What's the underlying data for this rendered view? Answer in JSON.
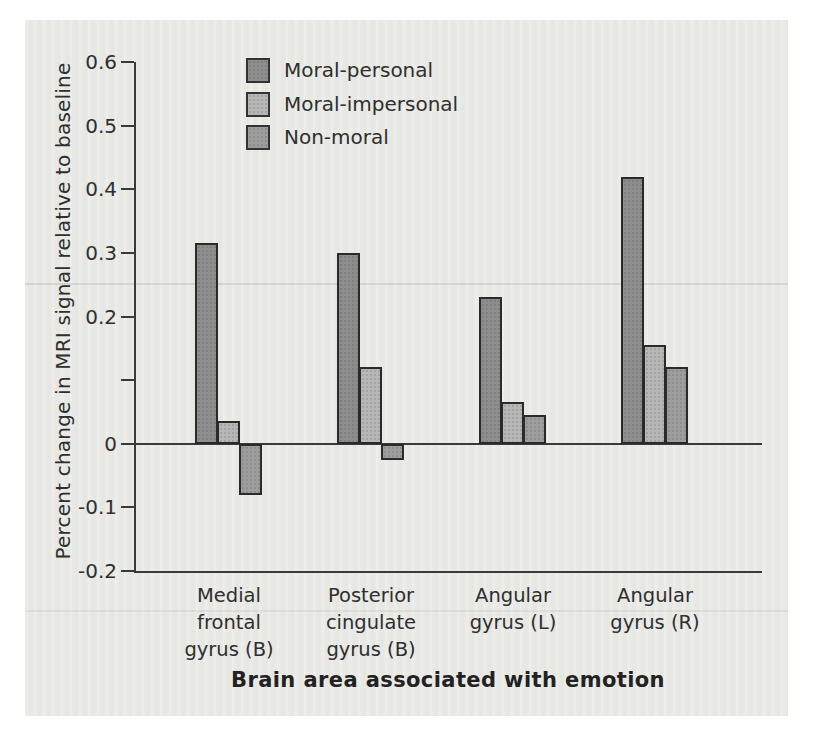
{
  "chart_data": {
    "type": "bar",
    "title": "",
    "xlabel": "Brain area associated with emotion",
    "ylabel": "Percent change in MRI signal relative to baseline",
    "ylim": [
      -0.2,
      0.6
    ],
    "grid": false,
    "legend_position": "top-left-inside",
    "yticks": [
      {
        "value": 0.6,
        "label": "0.6"
      },
      {
        "value": 0.5,
        "label": "0.5"
      },
      {
        "value": 0.4,
        "label": "0.4"
      },
      {
        "value": 0.3,
        "label": "0.3"
      },
      {
        "value": 0.2,
        "label": "0.2"
      },
      {
        "value": 0.1,
        "label": ""
      },
      {
        "value": 0,
        "label": "0"
      },
      {
        "value": -0.1,
        "label": "-0.1"
      },
      {
        "value": -0.2,
        "label": "-0.2"
      }
    ],
    "categories": [
      "Medial\nfrontal\ngyrus (B)",
      "Posterior\ncingulate\ngyrus (B)",
      "Angular\ngyrus (L)",
      "Angular\ngyrus (R)"
    ],
    "series": [
      {
        "name": "Moral-personal",
        "color": "#8e8e8e",
        "values": [
          0.315,
          0.3,
          0.23,
          0.42
        ]
      },
      {
        "name": "Moral-impersonal",
        "color": "#b7b7b7",
        "values": [
          0.035,
          0.12,
          0.065,
          0.155
        ]
      },
      {
        "name": "Non-moral",
        "color": "#9d9d9d",
        "values": [
          -0.08,
          -0.025,
          0.045,
          0.12
        ]
      }
    ]
  },
  "colors": {
    "page_bg": "#ffffff",
    "panel_bg": "#e9e9e6",
    "axis": "#3a3a3a",
    "text": "#2f2f2f",
    "bar_border": "#2a2a2a"
  }
}
